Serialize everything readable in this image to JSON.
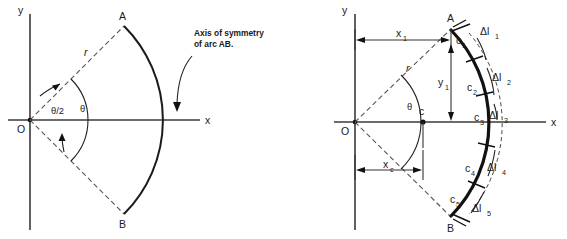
{
  "figure": {
    "panels": [
      {
        "id": "left",
        "name": "arc-definition-panel",
        "axis_y_label": "y",
        "axis_x_label": "x",
        "origin_label": "O",
        "point_a_label": "A",
        "point_b_label": "B",
        "radius_label": "r",
        "angle_half_label": "θ/2",
        "angle_full_label": "θ",
        "annotation_line1": "Axis of symmetry",
        "annotation_line2": "of arc AB."
      },
      {
        "id": "right",
        "name": "arc-discretization-panel",
        "axis_y_label": "y",
        "axis_x_label": "x",
        "origin_label": "O",
        "point_a_label": "A",
        "point_b_label": "B",
        "radius_label": "r",
        "angle_label": "θ",
        "centroid_label": "c",
        "dim_x1_label": "x",
        "dim_x1_sub": "1",
        "dim_xc_label": "x",
        "dim_xc_sub": "c",
        "dim_y1_label": "y",
        "dim_y1_sub": "1",
        "segment_centroids": [
          {
            "label": "c",
            "sub": "1"
          },
          {
            "label": "c",
            "sub": "2"
          },
          {
            "label": "c",
            "sub": "3"
          },
          {
            "label": "c",
            "sub": "4"
          },
          {
            "label": "c",
            "sub": "5"
          }
        ],
        "segment_lengths": [
          {
            "label": "Δl",
            "sub": "1"
          },
          {
            "label": "Δl",
            "sub": "2"
          },
          {
            "label": "Δl",
            "sub": "3"
          },
          {
            "label": "Δl",
            "sub": "4"
          },
          {
            "label": "Δl",
            "sub": "5"
          }
        ]
      }
    ]
  },
  "colors": {
    "axis": "#3a3a3a",
    "arc": "#111111",
    "dash": "#555555",
    "text": "#1a1a1a",
    "background": "#ffffff"
  }
}
